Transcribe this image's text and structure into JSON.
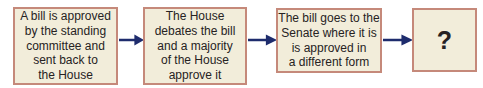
{
  "colors": {
    "background": "#ffffff",
    "box_fill": "#f2edda",
    "box_border": "#c5897a",
    "arrow": "#1e2c6d",
    "text": "#262223"
  },
  "diagram": {
    "type": "flowchart",
    "direction": "left-to-right",
    "steps": [
      {
        "text": "A bill is approved\nby the standing\ncommittee and\nsent back to\nthe House"
      },
      {
        "text": "The House\ndebates the bill\nand a majority\nof the House\napprove it"
      },
      {
        "text": "The bill goes to the\nSenate where it is\nis approved in\na different form"
      },
      {
        "text": "?"
      }
    ],
    "connector_style": "right-arrow"
  }
}
